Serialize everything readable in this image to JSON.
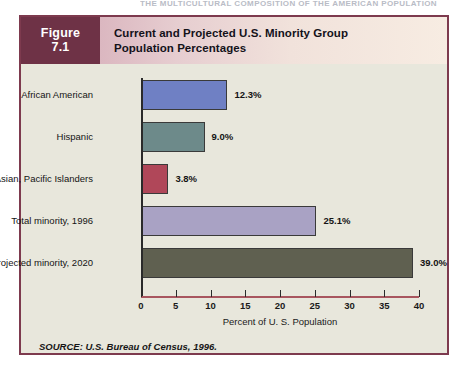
{
  "running_head": "THE MULTICULTURAL COMPOSITION OF THE AMERICAN POPULATION",
  "figure": {
    "label_word": "Figure",
    "number": "7.1",
    "title_line1": "Current and Projected U.S. Minority Group",
    "title_line2": "Population Percentages",
    "source": "SOURCE: U.S. Bureau of Census, 1996."
  },
  "colors": {
    "frame_border": "#7d3a4e",
    "figure_number_bg": "#6e3246",
    "plot_bg": "#e8e7dc",
    "axis": "#2a2a2a",
    "x_axis_rule": "#a8565f"
  },
  "chart_data": {
    "type": "bar",
    "orientation": "horizontal",
    "title": "Current and Projected U.S. Minority Group Population Percentages",
    "xlabel": "Percent of U. S. Population",
    "ylabel": "",
    "xlim": [
      0,
      40
    ],
    "xticks": [
      0,
      5,
      10,
      15,
      20,
      25,
      30,
      35,
      40
    ],
    "xtick_labels": [
      "0",
      "5",
      "10",
      "15",
      "20",
      "25",
      "30",
      "35",
      "40"
    ],
    "grid": false,
    "legend": "none",
    "categories": [
      "African American",
      "Hispanic",
      "Asian, Pacific Islanders",
      "Total minority, 1996",
      "Projected minority, 2020"
    ],
    "values": [
      12.3,
      9.0,
      3.8,
      25.1,
      39.0
    ],
    "value_labels": [
      "12.3%",
      "9.0%",
      "3.8%",
      "25.1%",
      "39.0%"
    ],
    "bar_colors": [
      "#6f80c4",
      "#6d8a8a",
      "#b04759",
      "#a9a2c4",
      "#5f6050"
    ],
    "source": "SOURCE: U.S. Bureau of Census, 1996."
  }
}
